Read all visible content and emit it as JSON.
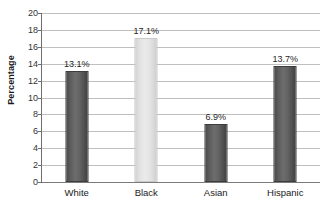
{
  "chart_data": {
    "type": "bar",
    "title": "",
    "subtitle": "",
    "xlabel": "",
    "ylabel": "Percentage",
    "categories": [
      "White",
      "Black",
      "Asian",
      "Hispanic"
    ],
    "values": [
      13.1,
      17.1,
      6.9,
      13.7
    ],
    "data_labels": [
      "13.1%",
      "17.1%",
      "6.9%",
      "13.7%"
    ],
    "ylim": [
      0,
      20
    ],
    "ytick_step": 2,
    "ytick_labels": [
      "20",
      "18",
      "16",
      "14",
      "12",
      "10",
      "8",
      "6",
      "4",
      "2",
      "0"
    ],
    "ytick_values": [
      20,
      18,
      16,
      14,
      12,
      10,
      8,
      6,
      4,
      2,
      0
    ],
    "grid": "horizontal",
    "legend": "none",
    "bar_colors": [
      "#5c5c5c",
      "#e4e4e4",
      "#5c5c5c",
      "#5c5c5c"
    ],
    "colors": {
      "bar_dark": "#5c5c5c",
      "bar_light": "#e4e4e4",
      "gridline": "#bfbfbf",
      "axis": "#6e6e6e",
      "text": "#1a1a1a",
      "background": "#ffffff"
    }
  }
}
